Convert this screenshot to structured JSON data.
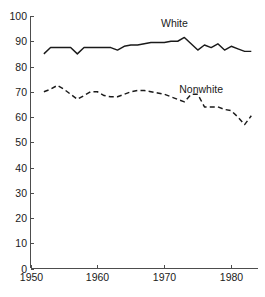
{
  "chart_data": {
    "type": "line",
    "title": "",
    "xlabel": "",
    "ylabel": "",
    "xlim": [
      1950,
      1984
    ],
    "ylim": [
      0,
      100
    ],
    "grid": false,
    "legend_position": "inline-annotation",
    "xticks": [
      1950,
      1960,
      1970,
      1980
    ],
    "xtick_labels": [
      "1950",
      "1960",
      "1970",
      "1980"
    ],
    "yticks": [
      0,
      10,
      20,
      30,
      40,
      50,
      60,
      70,
      80,
      90,
      100
    ],
    "ytick_labels": [
      "0",
      "10",
      "20",
      "30",
      "40",
      "50",
      "60",
      "70",
      "80",
      "90",
      "100"
    ],
    "x": [
      1952,
      1953,
      1954,
      1955,
      1956,
      1957,
      1958,
      1959,
      1960,
      1961,
      1962,
      1963,
      1964,
      1965,
      1966,
      1967,
      1968,
      1969,
      1970,
      1971,
      1972,
      1973,
      1974,
      1975,
      1976,
      1977,
      1978,
      1979,
      1980,
      1981,
      1982,
      1983
    ],
    "series": [
      {
        "name": "White",
        "style": "solid",
        "color": "#1a1a1a",
        "label_x": 1971.5,
        "label_y": 95.5,
        "values": [
          85,
          87.5,
          87.5,
          87.5,
          87.5,
          85,
          87.5,
          87.5,
          87.5,
          87.5,
          87.5,
          86.5,
          88,
          88.5,
          88.5,
          89,
          89.5,
          89.5,
          89.5,
          90,
          90,
          91.5,
          89,
          86.5,
          88.5,
          87.5,
          89,
          86.5,
          88,
          87,
          86,
          86
        ]
      },
      {
        "name": "Nonwhite",
        "style": "dashed",
        "color": "#1a1a1a",
        "label_x": 1975.5,
        "label_y": 69.5,
        "values": [
          70,
          71,
          72.5,
          71,
          69,
          67,
          68.5,
          70,
          70,
          68.5,
          68,
          68,
          69,
          70,
          70.5,
          70.5,
          70,
          69.5,
          69,
          68,
          67,
          66,
          69,
          69,
          64,
          64,
          64,
          63,
          62.5,
          60,
          57,
          60.5
        ]
      }
    ]
  }
}
